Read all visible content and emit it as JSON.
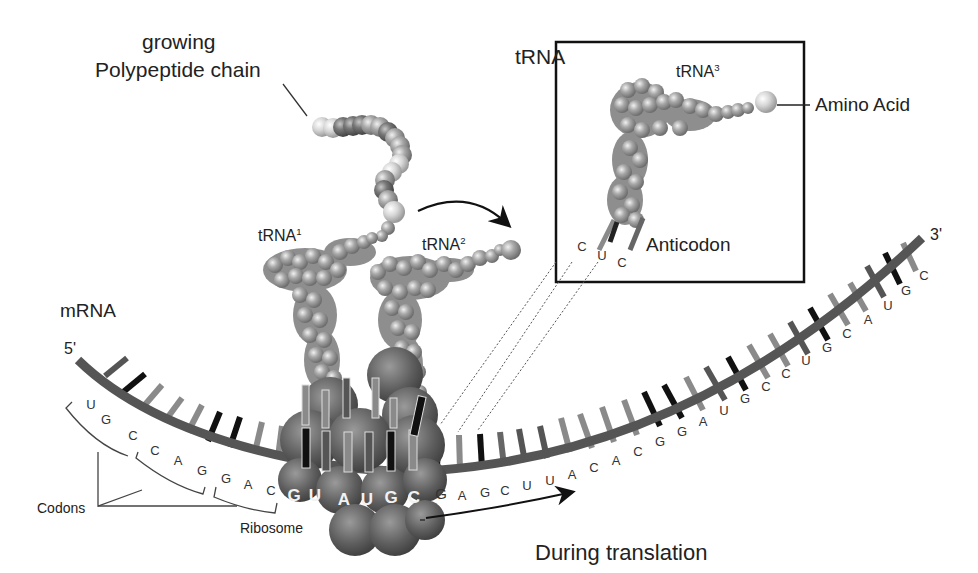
{
  "labels": {
    "growing": "growing",
    "polypeptide_chain": "Polypeptide chain",
    "trna_box_title": "tRNA",
    "trna1": "tRNA",
    "trna1_sup": "1",
    "trna2": "tRNA",
    "trna2_sup": "2",
    "trna3": "tRNA",
    "trna3_sup": "3",
    "amino_acid": "Amino Acid",
    "anticodon": "Anticodon",
    "mrna": "mRNA",
    "five_prime": "5'",
    "three_prime": "3'",
    "codons": "Codons",
    "ribosome": "Ribosome",
    "during_translation": "During translation"
  },
  "anticodon_bases": [
    "C",
    "U",
    "C"
  ],
  "mrna_sequence": [
    "U",
    "G",
    "C",
    "C",
    "A",
    "G",
    "G",
    "A",
    "C",
    "G",
    "U",
    "A",
    "U",
    "G",
    "C",
    "G",
    "A",
    "G",
    "C",
    "U",
    "U",
    "A",
    "C",
    "A",
    "C",
    "G",
    "G",
    "A",
    "U",
    "G",
    "C",
    "C",
    "U",
    "G",
    "C",
    "A",
    "U",
    "G",
    "C"
  ],
  "ribosome_bases": [
    "G",
    "U",
    "A",
    "U",
    "G",
    "C"
  ],
  "colors": {
    "backbone": "#555555",
    "base_dark": "#111111",
    "base_mid": "#555555",
    "base_light": "#8a8a8a",
    "trna": "#9a9a9a",
    "ribosome": "#5e5e5e",
    "box_border": "#111111"
  }
}
